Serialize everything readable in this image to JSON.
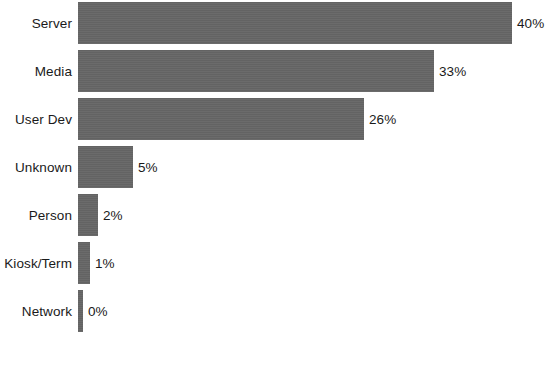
{
  "chart_data": {
    "type": "bar",
    "orientation": "horizontal",
    "title": "",
    "xlabel": "",
    "ylabel": "",
    "grid": false,
    "legend": null,
    "xlim": [
      0,
      40
    ],
    "categories": [
      "Server",
      "Media",
      "User Dev",
      "Unknown",
      "Person",
      "Kiosk/Term",
      "Network"
    ],
    "values": [
      40,
      33,
      26,
      5,
      2,
      1,
      0
    ],
    "value_labels": [
      "40%",
      "33%",
      "26%",
      "5%",
      "2%",
      "1%",
      "0%"
    ],
    "bar_pixel_widths": [
      434,
      356,
      286,
      55,
      20,
      12,
      5
    ],
    "bar_color": "#666666",
    "background_color": "#ffffff",
    "text_color": "#1a1a1a"
  },
  "rows": [
    {
      "label": "Server",
      "value_label": "40%",
      "width_px": 434
    },
    {
      "label": "Media",
      "value_label": "33%",
      "width_px": 356
    },
    {
      "label": "User Dev",
      "value_label": "26%",
      "width_px": 286
    },
    {
      "label": "Unknown",
      "value_label": "5%",
      "width_px": 55
    },
    {
      "label": "Person",
      "value_label": "2%",
      "width_px": 20
    },
    {
      "label": "Kiosk/Term",
      "value_label": "1%",
      "width_px": 12
    },
    {
      "label": "Network",
      "value_label": "0%",
      "width_px": 5
    }
  ],
  "footer": {
    "caption": ""
  }
}
